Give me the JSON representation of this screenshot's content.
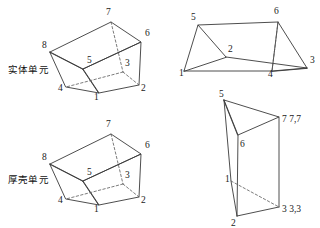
{
  "figure": {
    "title_labels": [
      {
        "id": "solid-element",
        "text": "实体单元",
        "x": 8,
        "y": 68
      },
      {
        "id": "thick-shell-element",
        "text": "厚壳单元",
        "x": 8,
        "y": 178
      }
    ]
  },
  "shapes": {
    "solid_hexahedron": {
      "name": "solid-element-hexahedron",
      "label": "实体单元",
      "node_labels": [
        {
          "n": "7",
          "x": 106,
          "y": 15
        },
        {
          "n": "6",
          "x": 145,
          "y": 36
        },
        {
          "n": "8",
          "x": 42,
          "y": 48
        },
        {
          "n": "5",
          "x": 87,
          "y": 63
        },
        {
          "n": "3",
          "x": 125,
          "y": 66
        },
        {
          "n": "4",
          "x": 58,
          "y": 91
        },
        {
          "n": "1",
          "x": 94,
          "y": 100
        },
        {
          "n": "2",
          "x": 141,
          "y": 91
        }
      ]
    },
    "shell_hexahedron": {
      "name": "thick-shell-hexahedron",
      "label": "厚壳单元",
      "node_labels": [
        {
          "n": "7",
          "x": 106,
          "y": 127
        },
        {
          "n": "6",
          "x": 145,
          "y": 148
        },
        {
          "n": "8",
          "x": 42,
          "y": 160
        },
        {
          "n": "5",
          "x": 87,
          "y": 175
        },
        {
          "n": "3",
          "x": 125,
          "y": 178
        },
        {
          "n": "4",
          "x": 58,
          "y": 203
        },
        {
          "n": "1",
          "x": 94,
          "y": 212
        },
        {
          "n": "2",
          "x": 141,
          "y": 203
        }
      ]
    },
    "wedge_prism": {
      "name": "wedge-prism",
      "node_labels": [
        {
          "n": "5",
          "x": 191,
          "y": 20
        },
        {
          "n": "6",
          "x": 274,
          "y": 14
        },
        {
          "n": "2",
          "x": 228,
          "y": 52
        },
        {
          "n": "3",
          "x": 310,
          "y": 63
        },
        {
          "n": "1",
          "x": 179,
          "y": 76
        },
        {
          "n": "4",
          "x": 268,
          "y": 77
        }
      ]
    },
    "degenerate_hexahedron": {
      "name": "degenerate-hexahedron",
      "node_labels": [
        {
          "n": "5",
          "x": 219,
          "y": 97
        },
        {
          "n": "6",
          "x": 240,
          "y": 142
        },
        {
          "n": "1",
          "x": 228,
          "y": 178
        },
        {
          "n": "2",
          "x": 233,
          "y": 222
        }
      ],
      "collapsed_labels": [
        {
          "text": "7 7,7",
          "x": 283,
          "y": 122
        },
        {
          "text": "3 3,3",
          "x": 283,
          "y": 212
        }
      ]
    }
  }
}
